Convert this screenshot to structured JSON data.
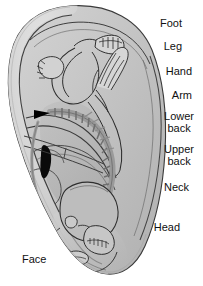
{
  "figure": {
    "kind": "auricular-reflexology-ear-map",
    "background_color": "#ffffff",
    "ear_fill_color": "#c9c9c9",
    "ear_rim_color": "#d8d8d8",
    "ear_inner_shadow_color": "#b4b4b4",
    "outline_color": "#2b2b2b",
    "marker_color": "#000000",
    "label_color": "#111111"
  },
  "labels": [
    {
      "id": "foot",
      "text": "Foot",
      "x": 182,
      "y": 18,
      "align": "right"
    },
    {
      "id": "leg",
      "text": "Leg",
      "x": 182,
      "y": 41,
      "align": "right"
    },
    {
      "id": "hand",
      "text": "Hand",
      "x": 192,
      "y": 66,
      "align": "right"
    },
    {
      "id": "arm",
      "text": "Arm",
      "x": 192,
      "y": 90,
      "align": "right"
    },
    {
      "id": "lower-back",
      "text": "Lower\nback",
      "x": 194,
      "y": 111,
      "align": "right"
    },
    {
      "id": "upper-back",
      "text": "Upper\nback",
      "x": 194,
      "y": 144,
      "align": "right"
    },
    {
      "id": "neck",
      "text": "Neck",
      "x": 189,
      "y": 182,
      "align": "right"
    },
    {
      "id": "head",
      "text": "Head",
      "x": 180,
      "y": 222,
      "align": "right"
    },
    {
      "id": "face",
      "text": "Face",
      "x": 22,
      "y": 254,
      "align": "left"
    }
  ],
  "anatomy_regions": [
    "helix",
    "antihelix",
    "scapha",
    "triangular-fossa",
    "concha",
    "tragus",
    "antitragus",
    "lobule"
  ],
  "inverted_fetus_parts": [
    "foot-toes",
    "leg",
    "hand-fingers",
    "arm",
    "vertebral-column",
    "ribs",
    "skull",
    "jaw",
    "teeth",
    "face"
  ]
}
